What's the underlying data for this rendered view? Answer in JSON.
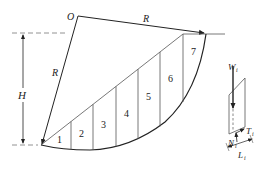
{
  "diagram": {
    "labels": {
      "center": "O",
      "radius_top": "R",
      "radius_left": "R",
      "height": "H",
      "weight": "W",
      "weight_sub": "i",
      "normal": "N",
      "normal_sub": "i",
      "shear": "T",
      "shear_sub": "i",
      "length": "L",
      "length_sub": "i"
    },
    "slices": [
      {
        "id": 1,
        "label": "1"
      },
      {
        "id": 2,
        "label": "2"
      },
      {
        "id": 3,
        "label": "3"
      },
      {
        "id": 4,
        "label": "4"
      },
      {
        "id": 5,
        "label": "5"
      },
      {
        "id": 6,
        "label": "6"
      },
      {
        "id": 7,
        "label": "7"
      }
    ],
    "colors": {
      "line": "#222222",
      "thin_line": "#555555",
      "dashed": "#777777"
    }
  }
}
